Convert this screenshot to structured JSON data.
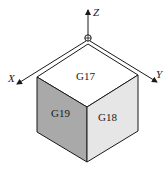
{
  "diagram": {
    "type": "isometric-cube-plane-selection",
    "axes": {
      "x": {
        "label": "X"
      },
      "y": {
        "label": "Y"
      },
      "z": {
        "label": "Z"
      }
    },
    "faces": {
      "top": {
        "label": "G17",
        "fill": "#ffffff"
      },
      "right": {
        "label": "G18",
        "fill": "#e6e6e6"
      },
      "left": {
        "label": "G19",
        "fill": "#a9a9a9"
      }
    },
    "colors": {
      "stroke": "#1a1a1a"
    }
  }
}
